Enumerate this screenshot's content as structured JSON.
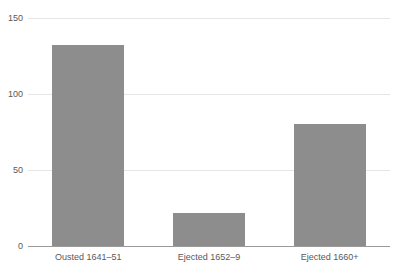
{
  "chart_data": {
    "type": "bar",
    "title": "",
    "subtitle": "",
    "xlabel": "",
    "ylabel": "",
    "categories": [
      "Ousted 1641–51",
      "Ejected 1652–9",
      "Ejected 1660+"
    ],
    "values": [
      132,
      22,
      80
    ],
    "series": [
      {
        "name": "Clergy",
        "values": [
          132,
          22,
          80
        ]
      }
    ],
    "ylim": [
      0,
      150
    ],
    "yticks": [
      0,
      50,
      100,
      150
    ],
    "ytick_labels": [
      "0",
      "50",
      "100",
      "150"
    ],
    "grid": true,
    "grid_axis": "y",
    "legend": false,
    "legend_position": "none",
    "annotations": [],
    "colors": {
      "bar_fill": "#8d8d8d",
      "gridline": "#e6e6e6",
      "axis_line": "#9a9a9a",
      "tick_label": "#58595b",
      "background": "#ffffff"
    }
  }
}
